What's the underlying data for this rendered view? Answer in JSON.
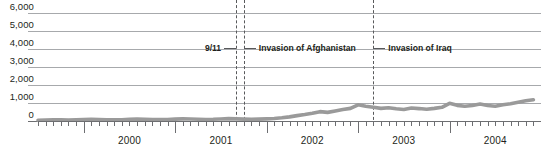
{
  "chart_data": {
    "type": "line",
    "title": "",
    "subtitle": "",
    "xlabel": "",
    "ylabel": "",
    "ylim": [
      0,
      6000
    ],
    "yticks": [
      0,
      1000,
      2000,
      3000,
      4000,
      5000,
      6000
    ],
    "ytick_labels": [
      "0",
      "1,000",
      "2,000",
      "3,000",
      "4,000",
      "5,000",
      "6,000"
    ],
    "xlim": [
      "1999-07",
      "2005-01"
    ],
    "xtick_labels": [
      "2000",
      "2001",
      "2002",
      "2003",
      "2004"
    ],
    "x_minor_tick_interval": "month",
    "grid": "horizontal",
    "legend": "none",
    "series": [
      {
        "name": "series-1",
        "color": "#9a9a9a",
        "x": [
          "1999-07",
          "1999-08",
          "1999-09",
          "1999-10",
          "1999-11",
          "1999-12",
          "2000-01",
          "2000-02",
          "2000-03",
          "2000-04",
          "2000-05",
          "2000-06",
          "2000-07",
          "2000-08",
          "2000-09",
          "2000-10",
          "2000-11",
          "2000-12",
          "2001-01",
          "2001-02",
          "2001-03",
          "2001-04",
          "2001-05",
          "2001-06",
          "2001-07",
          "2001-08",
          "2001-09",
          "2001-10",
          "2001-11",
          "2001-12",
          "2002-01",
          "2002-02",
          "2002-03",
          "2002-04",
          "2002-05",
          "2002-06",
          "2002-07",
          "2002-08",
          "2002-09",
          "2002-10",
          "2002-11",
          "2002-12",
          "2003-01",
          "2003-02",
          "2003-03",
          "2003-04",
          "2003-05",
          "2003-06",
          "2003-07",
          "2003-08",
          "2003-09",
          "2003-10",
          "2003-11",
          "2003-12",
          "2004-01",
          "2004-02",
          "2004-03",
          "2004-04",
          "2004-05",
          "2004-06",
          "2004-07",
          "2004-08",
          "2004-09",
          "2004-10",
          "2004-11",
          "2004-12"
        ],
        "values": [
          40,
          55,
          70,
          60,
          50,
          65,
          80,
          95,
          85,
          70,
          60,
          70,
          90,
          110,
          100,
          85,
          75,
          85,
          105,
          120,
          110,
          95,
          85,
          95,
          115,
          130,
          120,
          105,
          95,
          105,
          120,
          140,
          180,
          230,
          300,
          360,
          430,
          520,
          480,
          560,
          640,
          700,
          900,
          820,
          760,
          700,
          740,
          680,
          640,
          720,
          690,
          650,
          700,
          760,
          980,
          870,
          820,
          860,
          940,
          860,
          820,
          900,
          960,
          1040,
          1120,
          1180
        ]
      }
    ],
    "annotations": [
      {
        "id": "nine-eleven",
        "label": "9/11",
        "x": "2001-09",
        "marker": "dashed-vertical",
        "label_side": "left"
      },
      {
        "id": "invasion-afghanistan",
        "label": "Invasion of Afghanistan",
        "x": "2001-10",
        "marker": "dashed-vertical",
        "label_side": "right"
      },
      {
        "id": "invasion-iraq",
        "label": "Invasion of Iraq",
        "x": "2003-03",
        "marker": "dashed-vertical",
        "label_side": "right"
      }
    ],
    "colors": {
      "series_line": "#9a9a9a",
      "gridline": "#a7a9ac",
      "axis": "#6d6e71",
      "event_marker": "#58595b",
      "text": "#231f20"
    }
  }
}
